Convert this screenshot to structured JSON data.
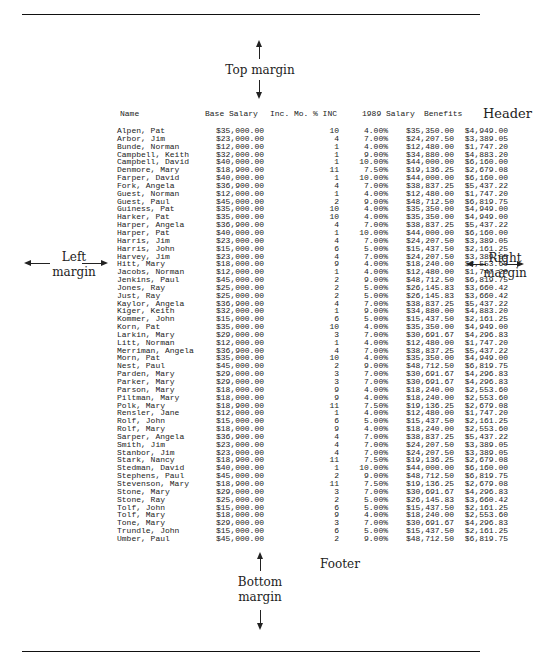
{
  "annotations": {
    "top_margin": "Top margin",
    "header": "Header",
    "left_margin_line1": "Left",
    "left_margin_line2": "margin",
    "right_margin_line1": "Right",
    "right_margin_line2": "margin",
    "footer": "Footer",
    "bottom_margin_line1": "Bottom",
    "bottom_margin_line2": "margin"
  },
  "table": {
    "headers": {
      "name": "Name",
      "base_salary": "Base Salary",
      "inc_mo": "Inc. Mo.",
      "pct_inc": "% INC",
      "salary_1989": "1989 Salary",
      "benefits": "Benefits"
    },
    "rows": [
      {
        "name": "Alpen, Pat",
        "base": "$35,000.00",
        "mo": "10",
        "inc": "4.00%",
        "sal": "$35,350.00",
        "ben": "$4,949.00"
      },
      {
        "name": "Arbor, Jim",
        "base": "$23,000.00",
        "mo": "4",
        "inc": "7.00%",
        "sal": "$24,207.50",
        "ben": "$3,389.05"
      },
      {
        "name": "Bunde, Norman",
        "base": "$12,000.00",
        "mo": "1",
        "inc": "4.00%",
        "sal": "$12,480.00",
        "ben": "$1,747.20"
      },
      {
        "name": "Campbell, Keith",
        "base": "$32,000.00",
        "mo": "1",
        "inc": "9.00%",
        "sal": "$34,880.00",
        "ben": "$4,883.20"
      },
      {
        "name": "Campbell, David",
        "base": "$40,000.00",
        "mo": "1",
        "inc": "10.00%",
        "sal": "$44,000.00",
        "ben": "$6,160.00"
      },
      {
        "name": "Denmore, Mary",
        "base": "$18,900.00",
        "mo": "11",
        "inc": "7.50%",
        "sal": "$19,136.25",
        "ben": "$2,679.08"
      },
      {
        "name": "Farper, David",
        "base": "$40,000.00",
        "mo": "1",
        "inc": "10.00%",
        "sal": "$44,000.00",
        "ben": "$6,160.00"
      },
      {
        "name": "Fork, Angela",
        "base": "$36,900.00",
        "mo": "4",
        "inc": "7.00%",
        "sal": "$38,837.25",
        "ben": "$5,437.22"
      },
      {
        "name": "Guest, Norman",
        "base": "$12,000.00",
        "mo": "1",
        "inc": "4.00%",
        "sal": "$12,480.00",
        "ben": "$1,747.20"
      },
      {
        "name": "Guest, Paul",
        "base": "$45,000.00",
        "mo": "2",
        "inc": "9.00%",
        "sal": "$48,712.50",
        "ben": "$6,819.75"
      },
      {
        "name": "Guiness, Pat",
        "base": "$35,000.00",
        "mo": "10",
        "inc": "4.00%",
        "sal": "$35,350.00",
        "ben": "$4,949.00"
      },
      {
        "name": "Harker, Pat",
        "base": "$35,000.00",
        "mo": "10",
        "inc": "4.00%",
        "sal": "$35,350.00",
        "ben": "$4,949.00"
      },
      {
        "name": "Harper, Angela",
        "base": "$36,900.00",
        "mo": "4",
        "inc": "7.00%",
        "sal": "$38,837.25",
        "ben": "$5,437.22"
      },
      {
        "name": "Harper, Pat",
        "base": "$40,000.00",
        "mo": "1",
        "inc": "10.00%",
        "sal": "$44,000.00",
        "ben": "$6,160.00"
      },
      {
        "name": "Harris, Jim",
        "base": "$23,000.00",
        "mo": "4",
        "inc": "7.00%",
        "sal": "$24,207.50",
        "ben": "$3,389.05"
      },
      {
        "name": "Harris, John",
        "base": "$15,000.00",
        "mo": "6",
        "inc": "5.00%",
        "sal": "$15,437.50",
        "ben": "$2,161.25"
      },
      {
        "name": "Harvey, Jim",
        "base": "$23,000.00",
        "mo": "4",
        "inc": "7.00%",
        "sal": "$24,207.50",
        "ben": "$3,389.05"
      },
      {
        "name": "Hitt, Mary",
        "base": "$18,000.00",
        "mo": "9",
        "inc": "4.00%",
        "sal": "$18,240.00",
        "ben": "$2,553.60"
      },
      {
        "name": "Jacobs, Norman",
        "base": "$12,000.00",
        "mo": "1",
        "inc": "4.00%",
        "sal": "$12,480.00",
        "ben": "$1,747.20"
      },
      {
        "name": "Jenkins, Paul",
        "base": "$45,000.00",
        "mo": "2",
        "inc": "9.00%",
        "sal": "$48,712.50",
        "ben": "$6,819.75"
      },
      {
        "name": "Jones, Ray",
        "base": "$25,000.00",
        "mo": "2",
        "inc": "5.00%",
        "sal": "$26,145.83",
        "ben": "$3,660.42"
      },
      {
        "name": "Just, Ray",
        "base": "$25,000.00",
        "mo": "2",
        "inc": "5.00%",
        "sal": "$26,145.83",
        "ben": "$3,660.42"
      },
      {
        "name": "Kaylor, Angela",
        "base": "$36,900.00",
        "mo": "4",
        "inc": "7.00%",
        "sal": "$38,837.25",
        "ben": "$5,437.22"
      },
      {
        "name": "Kiger, Keith",
        "base": "$32,000.00",
        "mo": "1",
        "inc": "9.00%",
        "sal": "$34,880.00",
        "ben": "$4,883.20"
      },
      {
        "name": "Kommer, John",
        "base": "$15,000.00",
        "mo": "6",
        "inc": "5.00%",
        "sal": "$15,437.50",
        "ben": "$2,161.25"
      },
      {
        "name": "Korn, Pat",
        "base": "$35,000.00",
        "mo": "10",
        "inc": "4.00%",
        "sal": "$35,350.00",
        "ben": "$4,949.00"
      },
      {
        "name": "Larkin, Mary",
        "base": "$29,000.00",
        "mo": "3",
        "inc": "7.00%",
        "sal": "$30,691.67",
        "ben": "$4,296.83"
      },
      {
        "name": "Litt, Norman",
        "base": "$12,000.00",
        "mo": "1",
        "inc": "4.00%",
        "sal": "$12,480.00",
        "ben": "$1,747.20"
      },
      {
        "name": "Merriman, Angela",
        "base": "$36,900.00",
        "mo": "4",
        "inc": "7.00%",
        "sal": "$38,837.25",
        "ben": "$5,437.22"
      },
      {
        "name": "Morn, Pat",
        "base": "$35,000.00",
        "mo": "10",
        "inc": "4.00%",
        "sal": "$35,350.00",
        "ben": "$4,949.00"
      },
      {
        "name": "Nest, Paul",
        "base": "$45,000.00",
        "mo": "2",
        "inc": "9.00%",
        "sal": "$48,712.50",
        "ben": "$6,819.75"
      },
      {
        "name": "Parden, Mary",
        "base": "$29,000.00",
        "mo": "3",
        "inc": "7.00%",
        "sal": "$30,691.67",
        "ben": "$4,296.83"
      },
      {
        "name": "Parker, Mary",
        "base": "$29,000.00",
        "mo": "3",
        "inc": "7.00%",
        "sal": "$30,691.67",
        "ben": "$4,296.83"
      },
      {
        "name": "Parson, Mary",
        "base": "$18,000.00",
        "mo": "9",
        "inc": "4.00%",
        "sal": "$18,240.00",
        "ben": "$2,553.60"
      },
      {
        "name": "Piltman, Mary",
        "base": "$18,000.00",
        "mo": "9",
        "inc": "4.00%",
        "sal": "$18,240.00",
        "ben": "$2,553.60"
      },
      {
        "name": "Polk, Mary",
        "base": "$18,900.00",
        "mo": "11",
        "inc": "7.50%",
        "sal": "$19,136.25",
        "ben": "$2,679.08"
      },
      {
        "name": "Rensler, Jane",
        "base": "$12,000.00",
        "mo": "1",
        "inc": "4.00%",
        "sal": "$12,480.00",
        "ben": "$1,747.20"
      },
      {
        "name": "Rolf, John",
        "base": "$15,000.00",
        "mo": "6",
        "inc": "5.00%",
        "sal": "$15,437.50",
        "ben": "$2,161.25"
      },
      {
        "name": "Rolf, Mary",
        "base": "$18,000.00",
        "mo": "9",
        "inc": "4.00%",
        "sal": "$18,240.00",
        "ben": "$2,553.60"
      },
      {
        "name": "Sarper, Angela",
        "base": "$36,900.00",
        "mo": "4",
        "inc": "7.00%",
        "sal": "$38,837.25",
        "ben": "$5,437.22"
      },
      {
        "name": "Smith, Jim",
        "base": "$23,000.00",
        "mo": "4",
        "inc": "7.00%",
        "sal": "$24,207.50",
        "ben": "$3,389.05"
      },
      {
        "name": "Stanbor, Jim",
        "base": "$23,000.00",
        "mo": "4",
        "inc": "7.00%",
        "sal": "$24,207.50",
        "ben": "$3,389.05"
      },
      {
        "name": "Stark, Nancy",
        "base": "$18,900.00",
        "mo": "11",
        "inc": "7.50%",
        "sal": "$19,136.25",
        "ben": "$2,679.08"
      },
      {
        "name": "Stedman, David",
        "base": "$40,000.00",
        "mo": "1",
        "inc": "10.00%",
        "sal": "$44,000.00",
        "ben": "$6,160.00"
      },
      {
        "name": "Stephens, Paul",
        "base": "$45,000.00",
        "mo": "2",
        "inc": "9.00%",
        "sal": "$48,712.50",
        "ben": "$6,819.75"
      },
      {
        "name": "Stevenson, Mary",
        "base": "$18,900.00",
        "mo": "11",
        "inc": "7.50%",
        "sal": "$19,136.25",
        "ben": "$2,679.08"
      },
      {
        "name": "Stone, Mary",
        "base": "$29,000.00",
        "mo": "3",
        "inc": "7.00%",
        "sal": "$30,691.67",
        "ben": "$4,296.83"
      },
      {
        "name": "Stone, Ray",
        "base": "$25,000.00",
        "mo": "2",
        "inc": "5.00%",
        "sal": "$26,145.83",
        "ben": "$3,660.42"
      },
      {
        "name": "Tolf, John",
        "base": "$15,000.00",
        "mo": "6",
        "inc": "5.00%",
        "sal": "$15,437.50",
        "ben": "$2,161.25"
      },
      {
        "name": "Tolf, Mary",
        "base": "$18,000.00",
        "mo": "9",
        "inc": "4.00%",
        "sal": "$18,240.00",
        "ben": "$2,553.60"
      },
      {
        "name": "Tone, Mary",
        "base": "$29,000.00",
        "mo": "3",
        "inc": "7.00%",
        "sal": "$30,691.67",
        "ben": "$4,296.83"
      },
      {
        "name": "Trundle, John",
        "base": "$15,000.00",
        "mo": "6",
        "inc": "5.00%",
        "sal": "$15,437.50",
        "ben": "$2,161.25"
      },
      {
        "name": "Umber, Paul",
        "base": "$45,000.00",
        "mo": "2",
        "inc": "9.00%",
        "sal": "$48,712.50",
        "ben": "$6,819.75"
      }
    ]
  }
}
